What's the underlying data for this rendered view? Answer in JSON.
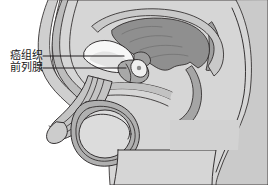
{
  "figure": {
    "type": "medical-illustration",
    "view": "male pelvis sagittal cross-section",
    "background_color": "#ffffff",
    "line_color": "#231f20",
    "palette": {
      "skin_light": "#d9d9d9",
      "tissue_mid": "#bdbdbd",
      "tissue_dark": "#9a9a9a",
      "organ_dark": "#8c8c8c",
      "bladder_white": "#f7f7f7",
      "highlight": "#ededed",
      "leader_line": "#231f20"
    }
  },
  "labels": [
    {
      "id": "cancer",
      "text": "癌组织",
      "leader_line": {
        "x1": 43,
        "y1": 56,
        "x2": 124,
        "y2": 56
      }
    },
    {
      "id": "prostate",
      "text": "前列腺",
      "leader_line": {
        "x1": 43,
        "y1": 68,
        "x2": 126,
        "y2": 68
      }
    }
  ],
  "structures": [
    {
      "name": "abdominal-wall",
      "fill": "#cfcfcf"
    },
    {
      "name": "rectum",
      "fill": "#8f8f8f"
    },
    {
      "name": "bladder",
      "fill": "#f7f7f7"
    },
    {
      "name": "prostate",
      "fill": "#a8a8a8"
    },
    {
      "name": "tumor-nodule",
      "fill": "#efefef"
    },
    {
      "name": "penis-shaft",
      "fill": "#c4c4c4"
    },
    {
      "name": "testis",
      "fill": "#dcdcdc"
    },
    {
      "name": "scrotum",
      "fill": "#b0b0b0"
    },
    {
      "name": "thigh-body",
      "fill": "#d6d6d6"
    },
    {
      "name": "sacrum-buttock",
      "fill": "#cacaca"
    }
  ]
}
